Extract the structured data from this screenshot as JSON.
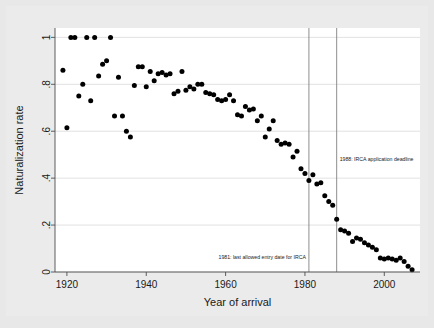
{
  "chart_data": {
    "type": "scatter",
    "title": "",
    "xlabel": "Year of arrival",
    "ylabel": "Naturalization rate",
    "xlim": [
      1917,
      2009
    ],
    "ylim": [
      0,
      1.04
    ],
    "xticks": [
      1920,
      1940,
      1960,
      1980,
      2000
    ],
    "xticklabels": [
      "1920",
      "1940",
      "1960",
      "1980",
      "2000"
    ],
    "yticks": [
      0,
      0.2,
      0.4,
      0.6,
      0.8,
      1
    ],
    "yticklabels": [
      "0",
      ".2",
      ".4",
      ".6",
      ".8",
      "1"
    ],
    "grid": "horizontal",
    "legend": "none",
    "marker": "filled-circle",
    "marker_color": "#000000",
    "plot_background": "#ffffff",
    "figure_background": "#ebebeb",
    "gridline_color": "#d9d9d9",
    "axis_color": "#4d4d4d",
    "annotations": [
      {
        "name": "irca-entry-date-line",
        "x": 1981,
        "label": "1981: last allowed entry date for IRCA",
        "label_y": 0.055,
        "label_anchor": "end"
      },
      {
        "name": "irca-application-deadline-line",
        "x": 1988,
        "label": "1988: IRCA application deadline",
        "label_y": 0.475,
        "label_anchor": "start"
      }
    ],
    "x": [
      1919,
      1920,
      1921,
      1922,
      1923,
      1924,
      1925,
      1926,
      1927,
      1928,
      1929,
      1930,
      1931,
      1932,
      1933,
      1934,
      1935,
      1936,
      1937,
      1938,
      1939,
      1940,
      1941,
      1942,
      1943,
      1944,
      1945,
      1946,
      1947,
      1948,
      1949,
      1950,
      1951,
      1952,
      1953,
      1954,
      1955,
      1956,
      1957,
      1958,
      1959,
      1960,
      1961,
      1962,
      1963,
      1964,
      1965,
      1966,
      1967,
      1968,
      1969,
      1970,
      1971,
      1972,
      1973,
      1974,
      1975,
      1976,
      1977,
      1978,
      1979,
      1980,
      1981,
      1982,
      1983,
      1984,
      1985,
      1986,
      1987,
      1988,
      1989,
      1990,
      1991,
      1992,
      1993,
      1994,
      1995,
      1996,
      1997,
      1998,
      1999,
      2000,
      2001,
      2002,
      2003,
      2004,
      2005,
      2006,
      2007
    ],
    "y": [
      0.86,
      0.615,
      1.0,
      1.0,
      0.75,
      0.8,
      1.0,
      0.73,
      1.0,
      0.835,
      0.885,
      0.9,
      1.0,
      0.665,
      0.83,
      0.665,
      0.6,
      0.575,
      0.795,
      0.875,
      0.875,
      0.79,
      0.855,
      0.815,
      0.845,
      0.85,
      0.84,
      0.845,
      0.76,
      0.77,
      0.855,
      0.775,
      0.79,
      0.78,
      0.8,
      0.8,
      0.765,
      0.76,
      0.755,
      0.735,
      0.73,
      0.735,
      0.755,
      0.73,
      0.67,
      0.665,
      0.705,
      0.69,
      0.695,
      0.645,
      0.665,
      0.575,
      0.61,
      0.645,
      0.56,
      0.545,
      0.55,
      0.545,
      0.49,
      0.515,
      0.44,
      0.42,
      0.39,
      0.415,
      0.375,
      0.38,
      0.325,
      0.3,
      0.285,
      0.225,
      0.18,
      0.175,
      0.165,
      0.13,
      0.145,
      0.14,
      0.125,
      0.115,
      0.105,
      0.095,
      0.06,
      0.055,
      0.06,
      0.055,
      0.05,
      0.06,
      0.045,
      0.025,
      0.01
    ]
  }
}
